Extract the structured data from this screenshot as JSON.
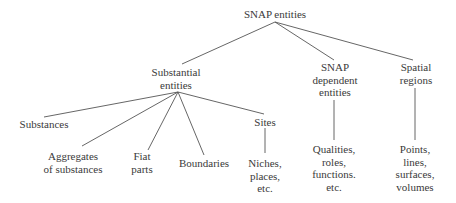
{
  "diagram": {
    "type": "tree",
    "root": {
      "id": "snap-entities",
      "lines": [
        "SNAP entities"
      ]
    },
    "nodes": [
      {
        "id": "snap-entities",
        "lines": [
          "SNAP entities"
        ]
      },
      {
        "id": "substantial-entities",
        "lines": [
          "Substantial",
          "entities"
        ]
      },
      {
        "id": "snap-dependent-entities",
        "lines": [
          "SNAP",
          "dependent",
          "entities"
        ]
      },
      {
        "id": "spatial-regions",
        "lines": [
          "Spatial",
          "regions"
        ]
      },
      {
        "id": "substances",
        "lines": [
          "Substances"
        ]
      },
      {
        "id": "aggregates-of-substances",
        "lines": [
          "Aggregates",
          "of substances"
        ]
      },
      {
        "id": "fiat-parts",
        "lines": [
          "Fiat",
          "parts"
        ]
      },
      {
        "id": "boundaries",
        "lines": [
          "Boundaries"
        ]
      },
      {
        "id": "sites",
        "lines": [
          "Sites"
        ]
      },
      {
        "id": "niches-places",
        "lines": [
          "Niches,",
          "places,",
          "etc."
        ]
      },
      {
        "id": "qualities-roles",
        "lines": [
          "Qualities,",
          "roles,",
          "functions.",
          "etc."
        ]
      },
      {
        "id": "points-lines",
        "lines": [
          "Points,",
          "lines,",
          "surfaces,",
          "volumes"
        ]
      }
    ],
    "edges": [
      {
        "from": "snap-entities",
        "to": "substantial-entities"
      },
      {
        "from": "snap-entities",
        "to": "snap-dependent-entities"
      },
      {
        "from": "snap-entities",
        "to": "spatial-regions"
      },
      {
        "from": "substantial-entities",
        "to": "substances"
      },
      {
        "from": "substantial-entities",
        "to": "aggregates-of-substances"
      },
      {
        "from": "substantial-entities",
        "to": "fiat-parts"
      },
      {
        "from": "substantial-entities",
        "to": "boundaries"
      },
      {
        "from": "substantial-entities",
        "to": "sites"
      },
      {
        "from": "sites",
        "to": "niches-places"
      },
      {
        "from": "snap-dependent-entities",
        "to": "qualities-roles"
      },
      {
        "from": "spatial-regions",
        "to": "points-lines"
      }
    ]
  },
  "labels": {
    "snap_entities": {
      "l1": "SNAP entities"
    },
    "substantial_entities": {
      "l1": "Substantial",
      "l2": "entities"
    },
    "snap_dependent": {
      "l1": "SNAP",
      "l2": "dependent",
      "l3": "entities"
    },
    "spatial_regions": {
      "l1": "Spatial",
      "l2": "regions"
    },
    "substances": {
      "l1": "Substances"
    },
    "aggregates": {
      "l1": "Aggregates",
      "l2": "of substances"
    },
    "fiat_parts": {
      "l1": "Fiat",
      "l2": "parts"
    },
    "boundaries": {
      "l1": "Boundaries"
    },
    "sites": {
      "l1": "Sites"
    },
    "niches": {
      "l1": "Niches,",
      "l2": "places,",
      "l3": "etc."
    },
    "qualities": {
      "l1": "Qualities,",
      "l2": "roles,",
      "l3": "functions.",
      "l4": "etc."
    },
    "points": {
      "l1": "Points,",
      "l2": "lines,",
      "l3": "surfaces,",
      "l4": "volumes"
    }
  },
  "colors": {
    "text": "#3a3a3a",
    "edge": "#555555",
    "background": "#ffffff"
  }
}
